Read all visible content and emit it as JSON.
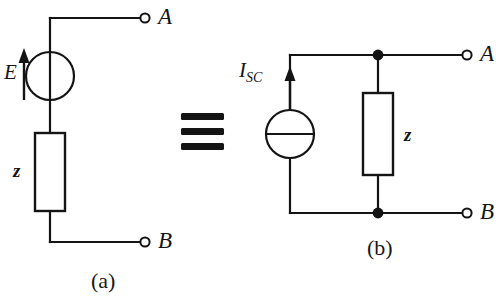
{
  "figure": {
    "type": "circuit-equivalence-diagram",
    "equivalence_symbol": "≡",
    "stroke_color": "#141414",
    "background_color": "#ffffff"
  },
  "circuit_a": {
    "caption": "(a)",
    "source": {
      "kind": "voltage-source",
      "symbol": "circle-with-vertical-bar",
      "label": "E",
      "arrow_direction": "up"
    },
    "impedance": {
      "kind": "impedance-box",
      "label": "z"
    },
    "terminals": [
      {
        "label": "A",
        "position": "top-right"
      },
      {
        "label": "B",
        "position": "bottom-right"
      }
    ]
  },
  "circuit_b": {
    "caption": "(b)",
    "source": {
      "kind": "current-source",
      "symbol": "circle-with-horizontal-bar",
      "label_main": "I",
      "label_sub": "SC",
      "label_full": "ISC",
      "arrow_direction": "up"
    },
    "impedance": {
      "kind": "impedance-box",
      "label": "z"
    },
    "terminals": [
      {
        "label": "A",
        "position": "top-right"
      },
      {
        "label": "B",
        "position": "bottom-right"
      }
    ],
    "junction_nodes": 2
  }
}
